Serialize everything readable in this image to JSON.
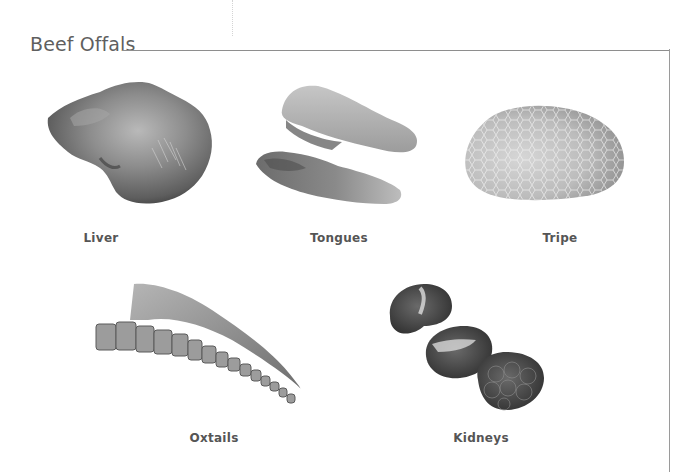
{
  "page": {
    "section_title": "Beef Offals"
  },
  "items": [
    {
      "label": "Liver",
      "image": "liver-photo"
    },
    {
      "label": "Tongues",
      "image": "tongues-photo"
    },
    {
      "label": "Tripe",
      "image": "tripe-photo"
    },
    {
      "label": "Oxtails",
      "image": "oxtails-photo"
    },
    {
      "label": "Kidneys",
      "image": "kidneys-photo"
    }
  ],
  "colors": {
    "title_text": "#5f5f5f",
    "label_text": "#555555",
    "frame_line": "#8e8e8e",
    "background": "#ffffff"
  }
}
